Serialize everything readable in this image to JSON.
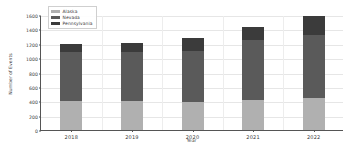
{
  "chart_data": {
    "type": "bar",
    "subtype": "stacked",
    "title": "",
    "xlabel": "Year",
    "ylabel": "Number of Events",
    "categories": [
      "2018",
      "2019",
      "2020",
      "2021",
      "2022"
    ],
    "series": [
      {
        "name": "Alaska",
        "color": "#b0b0b0",
        "values": [
          400,
          410,
          390,
          420,
          440
        ]
      },
      {
        "name": "Nevada",
        "color": "#5a5a5a",
        "values": [
          680,
          680,
          710,
          830,
          880
        ]
      },
      {
        "name": "Pennsylvania",
        "color": "#3b3b3b",
        "values": [
          115,
          120,
          175,
          190,
          260
        ]
      }
    ],
    "totals": [
      1195,
      1210,
      1275,
      1440,
      1580
    ],
    "ylim": [
      0,
      1600
    ],
    "yticks": [
      0,
      200,
      400,
      600,
      800,
      1000,
      1200,
      1400,
      1600
    ],
    "ytick_labels": [
      "0",
      "200",
      "400",
      "600",
      "800",
      "1000",
      "1200",
      "1400",
      "1600"
    ],
    "grid": true,
    "legend_position": "upper left"
  }
}
